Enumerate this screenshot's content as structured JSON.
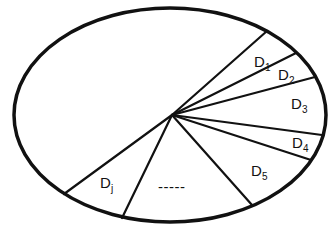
{
  "diagram": {
    "type": "partitioned-ellipse",
    "stroke_color": "#111111",
    "background": "#ffffff",
    "sectors": [
      {
        "label": "D",
        "sub": "1"
      },
      {
        "label": "D",
        "sub": "2"
      },
      {
        "label": "D",
        "sub": "3"
      },
      {
        "label": "D",
        "sub": "4"
      },
      {
        "label": "D",
        "sub": "5"
      },
      {
        "label": "-----",
        "sub": ""
      },
      {
        "label": "D",
        "sub": "j"
      }
    ]
  }
}
